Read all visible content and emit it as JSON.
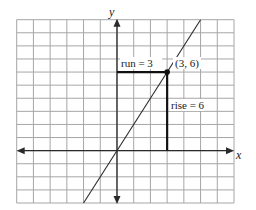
{
  "chart_data": {
    "type": "line",
    "title": "",
    "xlabel": "x",
    "ylabel": "y",
    "xlim": [
      -6,
      7
    ],
    "ylim": [
      -4,
      10
    ],
    "grid": true,
    "grid_step": 1,
    "series": [
      {
        "name": "line y = 2x",
        "x": [
          -2,
          5
        ],
        "y": [
          -4,
          10
        ]
      }
    ],
    "points": [
      {
        "x": 3,
        "y": 6,
        "label": "(3, 6)"
      }
    ],
    "annotations": [
      {
        "type": "run",
        "from": [
          0,
          6
        ],
        "to": [
          3,
          6
        ],
        "label": "run = 3"
      },
      {
        "type": "rise",
        "from": [
          3,
          0
        ],
        "to": [
          3,
          6
        ],
        "label": "rise = 6"
      }
    ],
    "colors": {
      "grid": "#a6a6a6",
      "axis": "#2a2a2a",
      "line": "#2a2a2a",
      "point": "#111111"
    }
  },
  "labels": {
    "x_axis": "x",
    "y_axis": "y",
    "point": "(3, 6)",
    "run": "run = 3",
    "rise": "rise = 6"
  }
}
